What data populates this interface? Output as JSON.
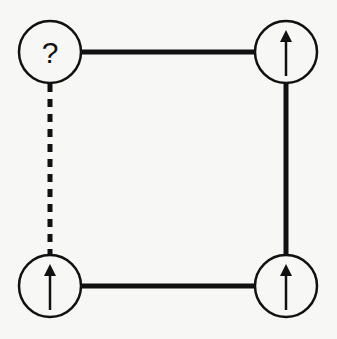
{
  "diagram": {
    "type": "spin-plaquette",
    "colors": {
      "ink": "#111111",
      "node_fill": "#f7f7f5",
      "background": "#f7f7f5"
    },
    "nodes": [
      {
        "id": "top-left",
        "cx": 50,
        "cy": 52,
        "r": 31,
        "state": "unknown",
        "label": "?"
      },
      {
        "id": "top-right",
        "cx": 286,
        "cy": 52,
        "r": 31,
        "state": "spin-up",
        "label": ""
      },
      {
        "id": "bottom-left",
        "cx": 50,
        "cy": 286,
        "r": 31,
        "state": "spin-up",
        "label": ""
      },
      {
        "id": "bottom-right",
        "cx": 286,
        "cy": 286,
        "r": 31,
        "state": "spin-up",
        "label": ""
      }
    ],
    "edges": [
      {
        "from": "top-left",
        "to": "top-right",
        "style": "solid"
      },
      {
        "from": "top-right",
        "to": "bottom-right",
        "style": "solid"
      },
      {
        "from": "bottom-left",
        "to": "bottom-right",
        "style": "solid"
      },
      {
        "from": "top-left",
        "to": "bottom-left",
        "style": "dashed"
      }
    ]
  }
}
